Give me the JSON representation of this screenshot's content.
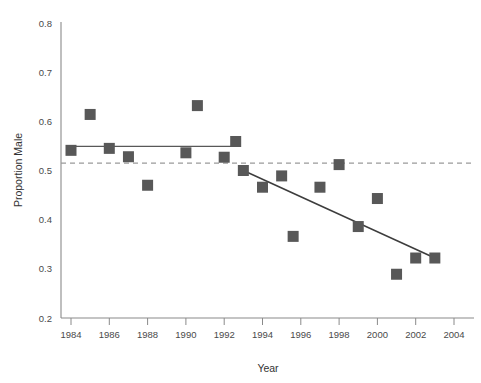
{
  "chart_data": {
    "type": "scatter",
    "title": "",
    "xlabel": "Year",
    "ylabel": "Proportion Male",
    "xlim": [
      1983,
      2004.5
    ],
    "ylim": [
      0.2,
      0.8
    ],
    "grid": false,
    "legend": "none",
    "xticks": [
      1984,
      1986,
      1988,
      1990,
      1992,
      1994,
      1996,
      1998,
      2000,
      2002,
      2004
    ],
    "xtick_labels": [
      "1984",
      "1986",
      "1988",
      "1990",
      "1992",
      "1994",
      "1996",
      "1998",
      "2000",
      "2002",
      "2004"
    ],
    "yticks": [
      0.2,
      0.3,
      0.4,
      0.5,
      0.6,
      0.7,
      0.8
    ],
    "ytick_labels": [
      "0.2",
      "0.3",
      "0.4",
      "0.5",
      "0.6",
      "0.7",
      "0.8"
    ],
    "marker": "square",
    "marker_color": "#585858",
    "points": [
      {
        "x": 1984,
        "y": 0.541
      },
      {
        "x": 1985,
        "y": 0.614
      },
      {
        "x": 1986,
        "y": 0.545
      },
      {
        "x": 1987,
        "y": 0.528
      },
      {
        "x": 1988,
        "y": 0.47
      },
      {
        "x": 1990,
        "y": 0.536
      },
      {
        "x": 1990.6,
        "y": 0.632
      },
      {
        "x": 1992,
        "y": 0.527
      },
      {
        "x": 1992.6,
        "y": 0.559
      },
      {
        "x": 1993,
        "y": 0.5
      },
      {
        "x": 1994,
        "y": 0.466
      },
      {
        "x": 1995,
        "y": 0.489
      },
      {
        "x": 1995.6,
        "y": 0.366
      },
      {
        "x": 1997,
        "y": 0.466
      },
      {
        "x": 1998,
        "y": 0.512
      },
      {
        "x": 1999,
        "y": 0.386
      },
      {
        "x": 2000,
        "y": 0.443
      },
      {
        "x": 2001,
        "y": 0.289
      },
      {
        "x": 2002,
        "y": 0.322
      },
      {
        "x": 2003,
        "y": 0.322
      }
    ],
    "reference_line": {
      "label": "reference proportion",
      "y": 0.515,
      "style": "dashed",
      "color": "#9a9a9a"
    },
    "trend_flat": {
      "label": "flat trend 1984-1992",
      "x_start": 1984,
      "x_end": 1992.6,
      "y_start": 0.549,
      "y_end": 0.549,
      "color": "#585858"
    },
    "trend_decline": {
      "label": "declining trend 1993-2003",
      "x_start": 1993,
      "x_end": 2003,
      "y_start": 0.5,
      "y_end": 0.322,
      "color": "#3d3d3d"
    }
  }
}
